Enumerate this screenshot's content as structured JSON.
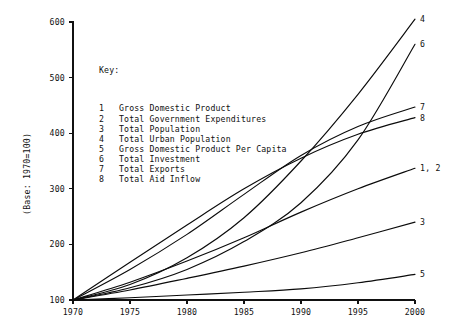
{
  "chart_data": {
    "type": "line",
    "title": "",
    "xlabel": "",
    "ylabel": "(Base: 1970=100)",
    "xlim": [
      1970,
      2000
    ],
    "ylim": [
      100,
      600
    ],
    "grid": false,
    "x_ticks": [
      "1970",
      "1975",
      "1980",
      "1985",
      "1990",
      "1995",
      "2000"
    ],
    "y_ticks": [
      "100",
      "200",
      "300",
      "400",
      "500",
      "600"
    ],
    "legend_position": "inside-upper-left",
    "legend_title": "Key:",
    "x": [
      1970,
      1975,
      1980,
      1985,
      1990,
      1995,
      2000
    ],
    "series": [
      {
        "key": "1",
        "name": "Gross Domestic Product",
        "end_label": "1, 2",
        "values": [
          100,
          132,
          170,
          212,
          258,
          300,
          337
        ]
      },
      {
        "key": "2",
        "name": "Total Government Expenditures",
        "end_label": "1, 2",
        "values": [
          100,
          132,
          170,
          212,
          258,
          300,
          337
        ]
      },
      {
        "key": "3",
        "name": "Total Population",
        "end_label": "3",
        "values": [
          100,
          118,
          139,
          161,
          185,
          212,
          240
        ]
      },
      {
        "key": "4",
        "name": "Total Urban Population",
        "end_label": "4",
        "values": [
          100,
          128,
          176,
          248,
          350,
          470,
          605
        ]
      },
      {
        "key": "5",
        "name": "Gross Domestic Product Per Capita",
        "end_label": "5",
        "values": [
          100,
          104,
          109,
          114,
          120,
          131,
          146
        ]
      },
      {
        "key": "6",
        "name": "Total Investment",
        "end_label": "6",
        "values": [
          100,
          122,
          155,
          205,
          275,
          388,
          560
        ]
      },
      {
        "key": "7",
        "name": "Total Exports",
        "end_label": "7",
        "values": [
          100,
          155,
          218,
          290,
          360,
          412,
          447
        ]
      },
      {
        "key": "8",
        "name": "Total Aid Inflow",
        "end_label": "8",
        "values": [
          100,
          168,
          235,
          300,
          355,
          398,
          428
        ]
      }
    ],
    "legend_entries": [
      {
        "key": "1",
        "label": "Gross Domestic Product"
      },
      {
        "key": "2",
        "label": "Total Government Expenditures"
      },
      {
        "key": "3",
        "label": "Total Population"
      },
      {
        "key": "4",
        "label": "Total Urban Population"
      },
      {
        "key": "5",
        "label": "Gross Domestic Product Per Capita"
      },
      {
        "key": "6",
        "label": "Total Investment"
      },
      {
        "key": "7",
        "label": "Total Exports"
      },
      {
        "key": "8",
        "label": "Total Aid Inflow"
      }
    ],
    "end_labels": [
      {
        "text": "4",
        "value": 605
      },
      {
        "text": "6",
        "value": 560
      },
      {
        "text": "7",
        "value": 447
      },
      {
        "text": "8",
        "value": 428
      },
      {
        "text": "1, 2",
        "value": 337
      },
      {
        "text": "3",
        "value": 240
      },
      {
        "text": "5",
        "value": 146
      }
    ]
  }
}
